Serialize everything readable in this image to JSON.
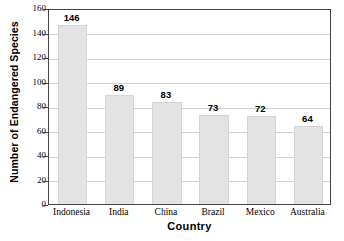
{
  "chart_data": {
    "type": "bar",
    "title": "",
    "xlabel": "Country",
    "ylabel": "Number of Endangered Species",
    "categories": [
      "Indonesia",
      "India",
      "China",
      "Brazil",
      "Mexico",
      "Australia"
    ],
    "values": [
      146,
      89,
      83,
      73,
      72,
      64
    ],
    "value_labels": [
      "146",
      "89",
      "83",
      "73",
      "72",
      "64"
    ],
    "ylim": [
      0,
      160
    ],
    "ytick_step": 20,
    "yticks": [
      160,
      140,
      120,
      100,
      80,
      60,
      40,
      20,
      0
    ],
    "ytick_labels": [
      "160",
      "140",
      "120",
      "100",
      "80",
      "60",
      "40",
      "20",
      "0"
    ],
    "grid": "horizontal",
    "legend": "none",
    "colors": {
      "bar_fill": "#e3e3e3",
      "bar_border": "#d5d5d5",
      "gridline": "#d0d0d0",
      "axis": "#444444",
      "text": "#000000",
      "background": "#ffffff"
    }
  }
}
